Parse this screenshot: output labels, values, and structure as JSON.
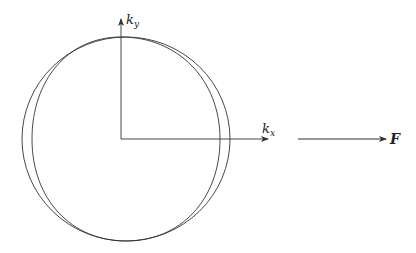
{
  "diagram": {
    "stroke_color": "#333333",
    "background": "#ffffff",
    "axes": {
      "y_label": {
        "base": "k",
        "sub": "y"
      },
      "x_label": {
        "base": "k",
        "sub": "x"
      }
    },
    "curves": [
      {
        "name": "outer-ellipse",
        "cx": 126,
        "cy": 139,
        "rx": 104,
        "ry": 102
      },
      {
        "name": "inner-ellipse",
        "cx": 126,
        "cy": 139,
        "rx": 94,
        "ry": 102
      }
    ],
    "force_arrow": {
      "label": "F"
    }
  }
}
